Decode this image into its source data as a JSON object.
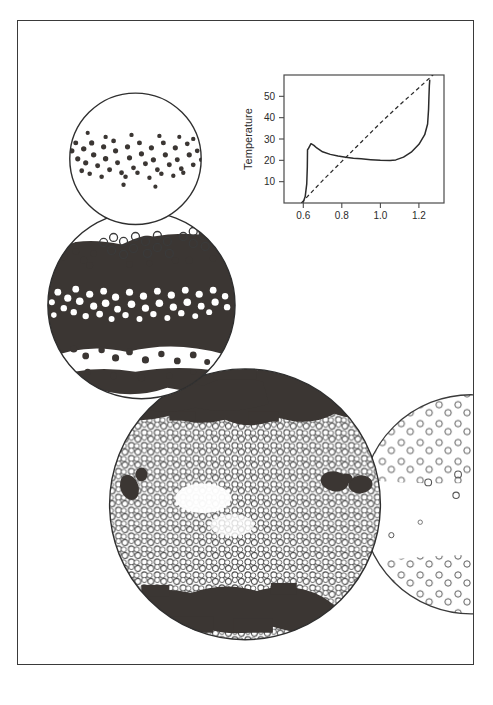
{
  "figure": {
    "caption": "",
    "background_color": "#ffffff",
    "border_color": "#3a3a3a",
    "ink_color": "#2b2b2b",
    "dark_region_color": "#3b3633"
  },
  "chart_data": {
    "type": "line",
    "title": "",
    "xlabel": "Solar luminosity",
    "ylabel": "Temperature",
    "xlim": [
      0.5,
      1.33
    ],
    "ylim": [
      0,
      60
    ],
    "xticks": [
      0.6,
      0.8,
      1.0,
      1.2
    ],
    "xtick_labels": [
      "0.6",
      "0.8",
      "1.0",
      "1.2"
    ],
    "yticks": [
      10,
      20,
      30,
      40,
      50
    ],
    "ytick_labels": [
      "10",
      "20",
      "30",
      "40",
      "50"
    ],
    "grid": false,
    "legend": null,
    "series": [
      {
        "name": "Daisyworld temperature (with daisies)",
        "style": "solid",
        "color": "#2b2b2b",
        "x": [
          0.6,
          0.61,
          0.618,
          0.621,
          0.622,
          0.625,
          0.64,
          0.655,
          0.67,
          0.7,
          0.74,
          0.78,
          0.82,
          0.86,
          0.9,
          0.95,
          1.0,
          1.05,
          1.08,
          1.12,
          1.16,
          1.2,
          1.23,
          1.245,
          1.25,
          1.252,
          1.254,
          1.256
        ],
        "y": [
          0.5,
          3.0,
          9.0,
          17.0,
          25.0,
          25.3,
          27.8,
          27.0,
          25.8,
          24.0,
          22.8,
          22.0,
          21.4,
          21.0,
          20.7,
          20.3,
          20.0,
          19.9,
          20.2,
          21.5,
          23.8,
          27.5,
          32.0,
          37.0,
          44.0,
          50.0,
          55.0,
          57.5
        ]
      },
      {
        "name": "Bare-planet temperature (no daisies)",
        "style": "dashed",
        "color": "#2b2b2b",
        "x": [
          0.59,
          0.7,
          0.8,
          0.9,
          1.0,
          1.1,
          1.2,
          1.29
        ],
        "y": [
          0.0,
          10.5,
          19.5,
          28.5,
          37.5,
          46.0,
          54.0,
          61.5
        ]
      }
    ]
  },
  "panels": [
    {
      "id": "panel-top",
      "name": "low-luminosity-planet",
      "description": "Small white sphere with a narrow equatorial band of dark daisies",
      "center": [
        118,
        138
      ],
      "radius": 66,
      "surface": "white",
      "features": "dark-daisy-equatorial-band"
    },
    {
      "id": "panel-middle",
      "name": "mid-luminosity-planet",
      "description": "Sphere mostly covered by dark daisies with a bright equatorial band of white daisies and scattered open daisies near the top",
      "center": [
        124,
        285
      ],
      "radius": 94,
      "surface": "dark",
      "features": "white-daisy-equatorial-band, open-daisy-cluster-north"
    },
    {
      "id": "panel-bottom",
      "name": "high-luminosity-planet",
      "description": "Large sphere densely covered with white daisies, with dark daisy caps at the poles and a few dark patches at mid-latitudes",
      "center": [
        228,
        485
      ],
      "radius": 136,
      "surface": "white-daisy-field",
      "features": "dark-polar-caps, dark-midlatitude-patches"
    },
    {
      "id": "panel-right",
      "name": "partial-planet-behind",
      "description": "Partially occluded sphere at the right edge with sparse white daisies",
      "center": [
        455,
        485
      ],
      "radius": 110,
      "surface": "sparse-white-daisy-field",
      "features": "sparse-daisies"
    }
  ]
}
